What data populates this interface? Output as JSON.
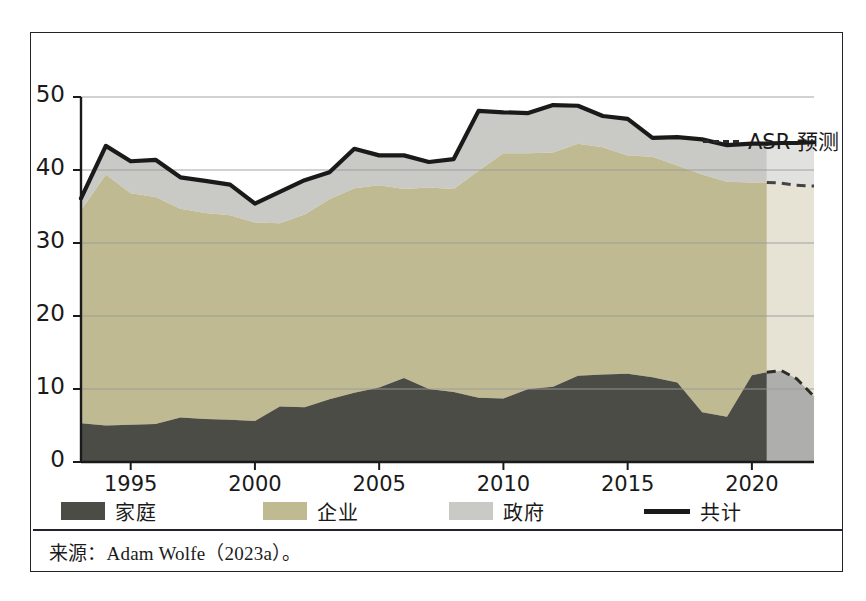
{
  "figure": {
    "source_note": "来源：Adam Wolfe（2023a）。"
  },
  "forecast_legend": {
    "label": "ASR 预测",
    "marker": "dashed-line-icon"
  },
  "legend": {
    "items": [
      {
        "label": "家庭",
        "key": "household",
        "color": "#4c4c47",
        "marker": "swatch"
      },
      {
        "label": "企业",
        "key": "corporate",
        "color": "#c0ba93",
        "marker": "swatch"
      },
      {
        "label": "政府",
        "key": "government",
        "color": "#c9cac6",
        "marker": "swatch"
      },
      {
        "label": "共计",
        "key": "total",
        "color": "#1a1a1a",
        "marker": "line"
      }
    ]
  },
  "chart_data": {
    "type": "area",
    "title": "",
    "subtitle": "",
    "xlabel": "",
    "ylabel": "",
    "stacked": true,
    "grid": true,
    "legend_position": "bottom",
    "xlim": [
      1993,
      2022.5
    ],
    "ylim": [
      0,
      50
    ],
    "yticks": [
      0,
      10,
      20,
      30,
      40,
      50
    ],
    "ytick_labels": [
      "0",
      "10",
      "20",
      "30",
      "40",
      "50"
    ],
    "xticks": [
      1995,
      2000,
      2005,
      2010,
      2015,
      2020
    ],
    "xtick_labels": [
      "1995",
      "2000",
      "2005",
      "2010",
      "2015",
      "2020"
    ],
    "forecast_start": 2020.6,
    "forecast_end": 2022.5,
    "x": [
      1993,
      1994,
      1995,
      1996,
      1997,
      1998,
      1999,
      2000,
      2001,
      2002,
      2003,
      2004,
      2005,
      2006,
      2007,
      2008,
      2009,
      2010,
      2011,
      2012,
      2013,
      2014,
      2015,
      2016,
      2017,
      2018,
      2019,
      2020,
      2020.6
    ],
    "series": [
      {
        "name": "家庭",
        "key": "household",
        "color": "#4c4c47",
        "values": [
          5.3,
          5.0,
          5.1,
          5.2,
          6.1,
          5.9,
          5.8,
          5.6,
          7.6,
          7.5,
          8.6,
          9.5,
          10.2,
          11.5,
          10.0,
          9.6,
          8.8,
          8.7,
          10.0,
          10.3,
          11.8,
          12.0,
          12.1,
          11.6,
          10.9,
          6.8,
          6.2,
          11.9,
          12.3
        ]
      },
      {
        "name": "企业",
        "key": "corporate",
        "color": "#c0ba93",
        "values": [
          29.2,
          34.4,
          31.7,
          31.1,
          28.6,
          28.2,
          28.0,
          27.2,
          25.1,
          26.4,
          27.4,
          28.0,
          27.7,
          25.9,
          27.6,
          27.8,
          31.1,
          33.6,
          32.3,
          32.1,
          31.8,
          31.1,
          29.9,
          30.2,
          29.7,
          32.6,
          32.2,
          26.4,
          26.0
        ]
      },
      {
        "name": "政府",
        "key": "government",
        "color": "#c9cac6",
        "values": [
          1.6,
          3.9,
          4.4,
          5.1,
          4.3,
          4.4,
          4.2,
          2.6,
          4.3,
          4.7,
          3.7,
          5.4,
          4.1,
          4.6,
          3.5,
          4.1,
          8.2,
          5.6,
          5.5,
          6.5,
          5.2,
          4.3,
          5.0,
          2.6,
          3.9,
          4.8,
          5.0,
          5.3,
          5.3
        ]
      }
    ],
    "total": {
      "name": "共计",
      "color": "#1a1a1a",
      "values": [
        36.1,
        43.3,
        41.2,
        41.4,
        39.0,
        38.5,
        38.0,
        35.4,
        37.0,
        38.6,
        39.7,
        42.9,
        42.0,
        42.0,
        41.1,
        41.5,
        48.1,
        47.9,
        47.8,
        48.9,
        48.8,
        47.4,
        47.0,
        44.4,
        44.5,
        44.2,
        43.4,
        43.6,
        43.6
      ]
    },
    "forecast": {
      "x": [
        2020.6,
        2021.2,
        2021.8,
        2022.5
      ],
      "total": {
        "name": "共计预测",
        "values": [
          43.6,
          43.7,
          43.7,
          43.8
        ]
      },
      "corporate_top": {
        "name": "家庭+企业预测",
        "values": [
          38.3,
          38.2,
          37.9,
          37.8
        ]
      },
      "household": {
        "name": "家庭预测",
        "values": [
          12.3,
          12.5,
          11.4,
          9.0
        ]
      }
    }
  }
}
